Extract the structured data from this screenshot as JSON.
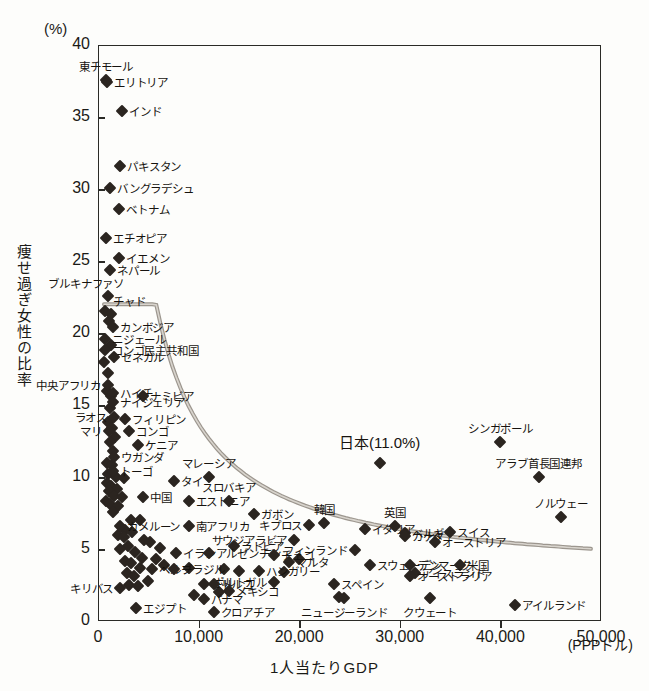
{
  "axes": {
    "y_unit": "(%)",
    "y_title": "痩せ過ぎ女性の比率",
    "x_title": "1人当たりGDP",
    "x_unit": "(PPPドル)",
    "y_ticks": [
      "40",
      "35",
      "30",
      "25",
      "20",
      "15",
      "10",
      "5",
      "0"
    ],
    "x_ticks": [
      "0",
      "10,000",
      "20,000",
      "30,000",
      "40,000",
      "50,000"
    ]
  },
  "highlight": {
    "japan_label": "日本(11.0%)"
  },
  "chart_data": {
    "type": "scatter",
    "title": "",
    "xlabel": "1人当たりGDP",
    "ylabel": "痩せ過ぎ女性の比率",
    "xunit": "(PPPドル)",
    "yunit": "(%)",
    "xlim": [
      0,
      50000
    ],
    "ylim": [
      0,
      40
    ],
    "grid": false,
    "legend": "none",
    "trendline": true,
    "points": [
      {
        "label": "東チモール",
        "x": 800,
        "y": 37.6,
        "lpos": "top"
      },
      {
        "label": "エリトリア",
        "x": 900,
        "y": 37.4,
        "lpos": "right"
      },
      {
        "label": "インド",
        "x": 2400,
        "y": 35.4,
        "lpos": "right"
      },
      {
        "label": "パキスタン",
        "x": 2200,
        "y": 31.6,
        "lpos": "right"
      },
      {
        "label": "バングラデシュ",
        "x": 1200,
        "y": 30.1,
        "lpos": "right"
      },
      {
        "label": "ベトナム",
        "x": 2100,
        "y": 28.6,
        "lpos": "right"
      },
      {
        "label": "エチオピア",
        "x": 800,
        "y": 26.6,
        "lpos": "right"
      },
      {
        "label": "イエメン",
        "x": 2100,
        "y": 25.2,
        "lpos": "right"
      },
      {
        "label": "ネパール",
        "x": 1200,
        "y": 24.4,
        "lpos": "right"
      },
      {
        "label": "ブルキナファソ",
        "x": 1000,
        "y": 22.6,
        "lpos": "topleft"
      },
      {
        "label": "チャド",
        "x": 1300,
        "y": 21.3,
        "lpos": "topright"
      },
      {
        "label": "カンボジア",
        "x": 1500,
        "y": 20.4,
        "lpos": "right"
      },
      {
        "label": "ニジェール",
        "x": 700,
        "y": 19.6,
        "lpos": "right"
      },
      {
        "label": "コンゴ民主共和国",
        "x": 700,
        "y": 18.8,
        "lpos": "right"
      },
      {
        "label": "セネガル",
        "x": 1600,
        "y": 18.3,
        "lpos": "right"
      },
      {
        "label": "中央アフリカ",
        "x": 1000,
        "y": 16.4,
        "lpos": "left"
      },
      {
        "label": "ハイチ",
        "x": 1500,
        "y": 15.8,
        "lpos": "right"
      },
      {
        "label": "ナミビア",
        "x": 4500,
        "y": 15.6,
        "lpos": "right"
      },
      {
        "label": "ナイジェリア",
        "x": 1500,
        "y": 15.2,
        "lpos": "right"
      },
      {
        "label": "ラオス",
        "x": 1600,
        "y": 14.2,
        "lpos": "left"
      },
      {
        "label": "フィリピン",
        "x": 2700,
        "y": 14.0,
        "lpos": "right"
      },
      {
        "label": "マリ",
        "x": 1100,
        "y": 13.2,
        "lpos": "left"
      },
      {
        "label": "コンゴ",
        "x": 3100,
        "y": 13.2,
        "lpos": "right"
      },
      {
        "label": "ケニア",
        "x": 4000,
        "y": 12.2,
        "lpos": "right"
      },
      {
        "label": "ウガンダ",
        "x": 1600,
        "y": 11.4,
        "lpos": "right"
      },
      {
        "label": "トーゴ",
        "x": 1500,
        "y": 10.4,
        "lpos": "right"
      },
      {
        "label": "マレーシア",
        "x": 11000,
        "y": 10.0,
        "lpos": "top"
      },
      {
        "label": "タイ",
        "x": 7600,
        "y": 9.7,
        "lpos": "right"
      },
      {
        "label": "中国",
        "x": 4500,
        "y": 8.6,
        "lpos": "right"
      },
      {
        "label": "エストニア",
        "x": 9000,
        "y": 8.3,
        "lpos": "right"
      },
      {
        "label": "スロバキア",
        "x": 13000,
        "y": 8.3,
        "lpos": "top"
      },
      {
        "label": "ガボン",
        "x": 15500,
        "y": 7.4,
        "lpos": "right"
      },
      {
        "label": "カメルーン",
        "x": 2200,
        "y": 6.6,
        "lpos": "right"
      },
      {
        "label": "南アフリカ",
        "x": 9000,
        "y": 6.6,
        "lpos": "right"
      },
      {
        "label": "キプロス",
        "x": 21000,
        "y": 6.7,
        "lpos": "left"
      },
      {
        "label": "韓国",
        "x": 22500,
        "y": 6.8,
        "lpos": "top"
      },
      {
        "label": "イタリア",
        "x": 26500,
        "y": 6.4,
        "lpos": "right"
      },
      {
        "label": "英国",
        "x": 29500,
        "y": 6.6,
        "lpos": "top"
      },
      {
        "label": "ベルギー",
        "x": 30500,
        "y": 6.1,
        "lpos": "right"
      },
      {
        "label": "カナダ",
        "x": 30500,
        "y": 5.9,
        "lpos": "right"
      },
      {
        "label": "スイス",
        "x": 35000,
        "y": 6.2,
        "lpos": "right"
      },
      {
        "label": "サウジアラビア",
        "x": 19500,
        "y": 5.6,
        "lpos": "left"
      },
      {
        "label": "ラトビア",
        "x": 13500,
        "y": 5.2,
        "lpos": "right"
      },
      {
        "label": "オーストリア",
        "x": 33500,
        "y": 5.5,
        "lpos": "right"
      },
      {
        "label": "フィンランド",
        "x": 25500,
        "y": 4.9,
        "lpos": "left"
      },
      {
        "label": "イラン",
        "x": 7800,
        "y": 4.7,
        "lpos": "right"
      },
      {
        "label": "アルゼンチン",
        "x": 11000,
        "y": 4.7,
        "lpos": "right"
      },
      {
        "label": "チェコ",
        "x": 17500,
        "y": 4.6,
        "lpos": "right"
      },
      {
        "label": "マルタ",
        "x": 19000,
        "y": 4.1,
        "lpos": "right"
      },
      {
        "label": "スウェーデン",
        "x": 27000,
        "y": 3.9,
        "lpos": "right"
      },
      {
        "label": "デンマーク",
        "x": 31000,
        "y": 3.9,
        "lpos": "right"
      },
      {
        "label": "米国",
        "x": 36000,
        "y": 3.9,
        "lpos": "right"
      },
      {
        "label": "ペルー",
        "x": 5400,
        "y": 3.6,
        "lpos": "right"
      },
      {
        "label": "ブラジル",
        "x": 7600,
        "y": 3.6,
        "lpos": "right"
      },
      {
        "label": "ハンガリー",
        "x": 16000,
        "y": 3.5,
        "lpos": "right"
      },
      {
        "label": "アイスランド",
        "x": 31500,
        "y": 3.3,
        "lpos": "right"
      },
      {
        "label": "オーストラリア",
        "x": 31000,
        "y": 3.1,
        "lpos": "right"
      },
      {
        "label": "ポルトガル",
        "x": 17500,
        "y": 2.7,
        "lpos": "left"
      },
      {
        "label": "スペイン",
        "x": 23500,
        "y": 2.6,
        "lpos": "right"
      },
      {
        "label": "チリ",
        "x": 10500,
        "y": 2.6,
        "lpos": "right"
      },
      {
        "label": "トルコ",
        "x": 11500,
        "y": 2.6,
        "lpos": "right"
      },
      {
        "label": "メキシコ",
        "x": 13000,
        "y": 2.1,
        "lpos": "right"
      },
      {
        "label": "キリバス",
        "x": 2200,
        "y": 2.3,
        "lpos": "left"
      },
      {
        "label": "パナマ",
        "x": 10500,
        "y": 1.5,
        "lpos": "right"
      },
      {
        "label": "ニュージーランド",
        "x": 24500,
        "y": 1.6,
        "lpos": "bottom"
      },
      {
        "label": "クウェート",
        "x": 33000,
        "y": 1.6,
        "lpos": "bottom"
      },
      {
        "label": "アイルランド",
        "x": 41500,
        "y": 1.1,
        "lpos": "right"
      },
      {
        "label": "エジプト",
        "x": 3800,
        "y": 0.9,
        "lpos": "right"
      },
      {
        "label": "クロアチア",
        "x": 11500,
        "y": 0.6,
        "lpos": "right"
      },
      {
        "label": "日本",
        "x": 28000,
        "y": 11.0,
        "lpos": "bigtop"
      },
      {
        "label": "シンガポール",
        "x": 40000,
        "y": 12.4,
        "lpos": "top"
      },
      {
        "label": "アラブ首長国連邦",
        "x": 43800,
        "y": 10.0,
        "lpos": "top"
      },
      {
        "label": "ノルウェー",
        "x": 46000,
        "y": 7.2,
        "lpos": "top"
      }
    ],
    "unlabeled_points": [
      {
        "x": 700,
        "y": 21.5
      },
      {
        "x": 1100,
        "y": 20.8
      },
      {
        "x": 1300,
        "y": 19.2
      },
      {
        "x": 600,
        "y": 18.0
      },
      {
        "x": 1000,
        "y": 17.2
      },
      {
        "x": 900,
        "y": 16.0
      },
      {
        "x": 1300,
        "y": 15.6
      },
      {
        "x": 1200,
        "y": 14.8
      },
      {
        "x": 1000,
        "y": 13.8
      },
      {
        "x": 1400,
        "y": 13.4
      },
      {
        "x": 1700,
        "y": 12.8
      },
      {
        "x": 1200,
        "y": 12.4
      },
      {
        "x": 1500,
        "y": 11.8
      },
      {
        "x": 900,
        "y": 11.0
      },
      {
        "x": 1400,
        "y": 10.8
      },
      {
        "x": 1000,
        "y": 10.2
      },
      {
        "x": 1800,
        "y": 10.0
      },
      {
        "x": 2600,
        "y": 9.9
      },
      {
        "x": 900,
        "y": 9.6
      },
      {
        "x": 1300,
        "y": 9.4
      },
      {
        "x": 1900,
        "y": 9.2
      },
      {
        "x": 1100,
        "y": 9.0
      },
      {
        "x": 1600,
        "y": 8.7
      },
      {
        "x": 2400,
        "y": 8.6
      },
      {
        "x": 800,
        "y": 8.3
      },
      {
        "x": 1200,
        "y": 8.1
      },
      {
        "x": 2000,
        "y": 8.0
      },
      {
        "x": 1500,
        "y": 7.6
      },
      {
        "x": 3300,
        "y": 7.0
      },
      {
        "x": 4200,
        "y": 7.0
      },
      {
        "x": 2700,
        "y": 6.3
      },
      {
        "x": 3400,
        "y": 6.2
      },
      {
        "x": 2000,
        "y": 6.0
      },
      {
        "x": 2600,
        "y": 5.8
      },
      {
        "x": 4600,
        "y": 5.6
      },
      {
        "x": 5200,
        "y": 5.5
      },
      {
        "x": 3000,
        "y": 5.2
      },
      {
        "x": 6200,
        "y": 5.1
      },
      {
        "x": 2200,
        "y": 5.0
      },
      {
        "x": 3700,
        "y": 4.8
      },
      {
        "x": 4400,
        "y": 4.4
      },
      {
        "x": 5800,
        "y": 4.3
      },
      {
        "x": 2700,
        "y": 4.2
      },
      {
        "x": 3300,
        "y": 4.0
      },
      {
        "x": 6600,
        "y": 3.9
      },
      {
        "x": 4200,
        "y": 3.7
      },
      {
        "x": 9000,
        "y": 3.7
      },
      {
        "x": 12500,
        "y": 3.6
      },
      {
        "x": 14000,
        "y": 3.5
      },
      {
        "x": 2900,
        "y": 3.3
      },
      {
        "x": 3600,
        "y": 3.1
      },
      {
        "x": 5000,
        "y": 2.8
      },
      {
        "x": 3100,
        "y": 2.5
      },
      {
        "x": 4000,
        "y": 2.4
      },
      {
        "x": 12000,
        "y": 2.0
      },
      {
        "x": 9500,
        "y": 1.8
      },
      {
        "x": 18500,
        "y": 3.4
      },
      {
        "x": 20000,
        "y": 4.3
      },
      {
        "x": 24000,
        "y": 1.7
      }
    ]
  }
}
